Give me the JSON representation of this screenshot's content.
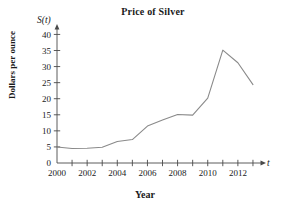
{
  "chart_data": {
    "type": "line",
    "title": "Price of Silver",
    "xlabel": "Year",
    "ylabel": "Dollars per ounce",
    "x_axis_variable": "t",
    "y_axis_variable": "S(t)",
    "x": [
      2000,
      2001,
      2002,
      2003,
      2004,
      2005,
      2006,
      2007,
      2008,
      2009,
      2010,
      2011,
      2012,
      2013
    ],
    "values": [
      5.0,
      4.5,
      4.6,
      4.9,
      6.7,
      7.3,
      11.5,
      13.4,
      15.1,
      14.9,
      20.2,
      35.1,
      31.2,
      24.4
    ],
    "xlim": [
      2000,
      2013.6
    ],
    "ylim": [
      0,
      42
    ],
    "x_tick_values": [
      2000,
      2001,
      2002,
      2003,
      2004,
      2005,
      2006,
      2007,
      2008,
      2009,
      2010,
      2011,
      2012,
      2013
    ],
    "x_tick_labels": [
      "2000",
      "",
      "2002",
      "",
      "2004",
      "",
      "2006",
      "",
      "2008",
      "",
      "2010",
      "",
      "2012",
      ""
    ],
    "y_ticks": [
      0,
      5,
      10,
      15,
      20,
      25,
      30,
      35,
      40
    ],
    "y_tick_labels": [
      "0",
      "5",
      "10",
      "15",
      "20",
      "25",
      "30",
      "35",
      "40"
    ],
    "grid": false,
    "legend": false,
    "line_color": "#8a8a8a",
    "axis_color": "#4a4a4a"
  }
}
